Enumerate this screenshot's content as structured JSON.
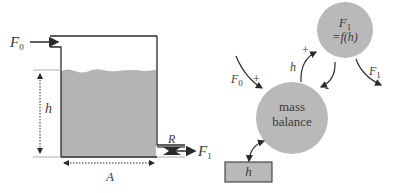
{
  "tank": {
    "inflow_label": "F",
    "inflow_sub": "0",
    "height_label": "h",
    "area_label": "A",
    "valve_label": "R",
    "outflow_label": "F",
    "outflow_sub": "1"
  },
  "graph": {
    "function_node": {
      "line1_main": "F",
      "line1_sub": "1",
      "line2": "=f(h)"
    },
    "balance_node": {
      "line1": "mass",
      "line2": "balance"
    },
    "state_box": {
      "label": "h"
    },
    "edges": {
      "inflow": {
        "label": "F",
        "sub": "0",
        "sign": "+"
      },
      "h_to_function": {
        "label": "h",
        "sign": "+"
      },
      "function_to_balance": {
        "sign": "-"
      },
      "outflow": {
        "label": "F",
        "sub": "1"
      }
    }
  },
  "colors": {
    "liquid": "#b4b4b4",
    "node_fill": "#b9b9b9",
    "line": "#2a2a2a"
  }
}
